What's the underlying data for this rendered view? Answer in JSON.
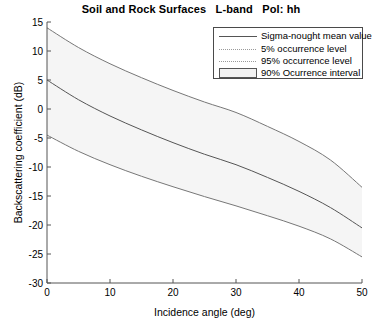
{
  "chart_data": {
    "type": "line",
    "title": "Soil and Rock Surfaces   L-band   Pol: hh",
    "xlabel": "Incidence angle (deg)",
    "ylabel": "Backscattering coefficient (dB)",
    "xlim": [
      0,
      50
    ],
    "ylim": [
      -30,
      15
    ],
    "xticks": [
      0,
      10,
      20,
      30,
      40,
      50
    ],
    "yticks": [
      -30,
      -25,
      -20,
      -15,
      -10,
      -5,
      0,
      5,
      10,
      15
    ],
    "grid": false,
    "legend_position": "top-right",
    "x": [
      0,
      5,
      10,
      15,
      20,
      25,
      30,
      35,
      40,
      45,
      50
    ],
    "series": [
      {
        "name": "95% occurrence level",
        "values": [
          14.0,
          10.6,
          7.8,
          5.4,
          3.2,
          1.2,
          -0.6,
          -3.0,
          -5.6,
          -8.8,
          -13.5
        ]
      },
      {
        "name": "Sigma-nought mean value",
        "values": [
          5.0,
          1.6,
          -1.2,
          -3.6,
          -5.8,
          -7.8,
          -9.6,
          -11.8,
          -14.2,
          -17.0,
          -20.5
        ]
      },
      {
        "name": "5% occurrence level",
        "values": [
          -4.5,
          -7.3,
          -9.6,
          -11.6,
          -13.4,
          -15.1,
          -16.7,
          -18.4,
          -20.2,
          -22.4,
          -25.5
        ]
      }
    ],
    "band": {
      "name": "90% Ocurrence interval",
      "upper_series": "95% occurrence level",
      "lower_series": "5% occurrence level",
      "fill_color": "#f5f5f5"
    },
    "colors": {
      "mean_line": "#555555",
      "percentile_line": "#777777",
      "axis": "#555555",
      "band_fill": "#f5f5f5"
    }
  },
  "legend": {
    "entries": [
      {
        "label": "Sigma-nought mean value",
        "style": "solid"
      },
      {
        "label": "5% occurrence level",
        "style": "dotted"
      },
      {
        "label": "95% occurrence level",
        "style": "dotted"
      },
      {
        "label": "90% Ocurrence interval",
        "style": "patch"
      }
    ]
  },
  "axis_tick_text": {
    "y": [
      "15",
      "10",
      "5",
      "0",
      "-5",
      "-10",
      "-15",
      "-20",
      "-25",
      "-30"
    ],
    "x": [
      "0",
      "10",
      "20",
      "30",
      "40",
      "50"
    ]
  }
}
